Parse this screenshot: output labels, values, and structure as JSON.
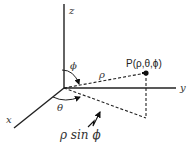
{
  "diagram": {
    "axes": {
      "x_label": "x",
      "y_label": "y",
      "z_label": "z"
    },
    "point_label": "P(ρ,θ,ϕ)",
    "rho_label": "ρ",
    "phi_label": "ϕ",
    "theta_label": "θ",
    "projection_label": "ρ sin ϕ",
    "colors": {
      "line": "#222222",
      "background": "#ffffff"
    }
  }
}
